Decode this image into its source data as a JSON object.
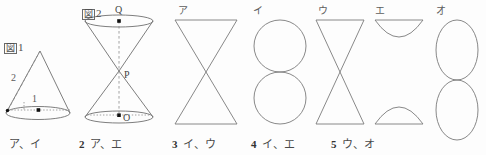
{
  "figures": [
    {
      "id": "fig1",
      "label_box": "図",
      "label_num": "1",
      "type": "cone",
      "dimensions": [
        {
          "name": "slant-height",
          "value": "2"
        },
        {
          "name": "base-radius",
          "value": "1"
        }
      ],
      "points": []
    },
    {
      "id": "fig2",
      "label_box": "図",
      "label_num": "2",
      "type": "double-cone",
      "dimensions": [],
      "points": [
        {
          "name": "top-center",
          "value": "Q"
        },
        {
          "name": "apex",
          "value": "P"
        },
        {
          "name": "bottom-center",
          "value": "O"
        }
      ]
    }
  ],
  "options": [
    {
      "key": "ア",
      "shape": "bowtie-wide"
    },
    {
      "key": "イ",
      "shape": "two-circles"
    },
    {
      "key": "ウ",
      "shape": "bowtie-narrow"
    },
    {
      "key": "エ",
      "shape": "bowl-and-dome"
    },
    {
      "key": "オ",
      "shape": "two-ellipses"
    }
  ],
  "answers": [
    {
      "num": "",
      "text": "ア、イ"
    },
    {
      "num": "2",
      "text": "ア、エ"
    },
    {
      "num": "3",
      "text": "イ、ウ"
    },
    {
      "num": "4",
      "text": "イ、エ"
    },
    {
      "num": "5",
      "text": "ウ、オ"
    }
  ],
  "colors": {
    "stroke": "#6f6f6f",
    "dashed": "#8a8a8a",
    "text": "#4a4a4a",
    "marker": "#111111",
    "background": "#fdfdfd"
  }
}
